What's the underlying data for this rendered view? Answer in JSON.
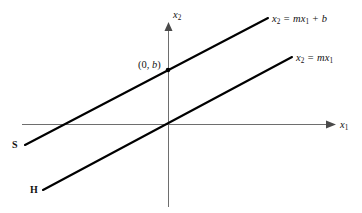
{
  "figure": {
    "type": "line-graph-diagram",
    "background_color": "#ffffff",
    "line_color": "#000000",
    "axis_color": "#6e6e6e",
    "text_color": "#141414"
  },
  "axes": {
    "x_axis": {
      "label": "x",
      "label_sub": "1",
      "name": "horizontal-axis",
      "arrow": true,
      "y_pixel": 124,
      "x_start": 22,
      "x_end": 330
    },
    "y_axis": {
      "label": "x",
      "label_sub": "2",
      "name": "vertical-axis",
      "arrow": true,
      "x_pixel": 168,
      "y_start": 26,
      "y_end": 207
    },
    "origin": {
      "x": 168,
      "y": 124
    }
  },
  "lines": [
    {
      "id": "line-s",
      "equation_lhs": "x",
      "equation_lhs_sub": "2",
      "equation_rhs": "= mx",
      "equation_rhs_sub": "1",
      "equation_tail": "+ b",
      "label_full": "x2 = mx1 + b",
      "endpoint_label": "S",
      "slope_sign": "positive",
      "passes_through_origin": false,
      "y_intercept_label": "(0, b)",
      "p1": {
        "x": 25,
        "y": 145
      },
      "p2": {
        "x": 268,
        "y": 18
      }
    },
    {
      "id": "line-h",
      "equation_lhs": "x",
      "equation_lhs_sub": "2",
      "equation_rhs": "= mx",
      "equation_rhs_sub": "1",
      "equation_tail": "",
      "label_full": "x2 = mx1",
      "endpoint_label": "H",
      "slope_sign": "positive",
      "passes_through_origin": true,
      "p1": {
        "x": 43,
        "y": 190
      },
      "p2": {
        "x": 292,
        "y": 57
      }
    }
  ],
  "points": [
    {
      "id": "y-intercept",
      "label_open": "(0, ",
      "label_italic": "b",
      "label_close": ")",
      "x": 168,
      "y": 70
    }
  ]
}
